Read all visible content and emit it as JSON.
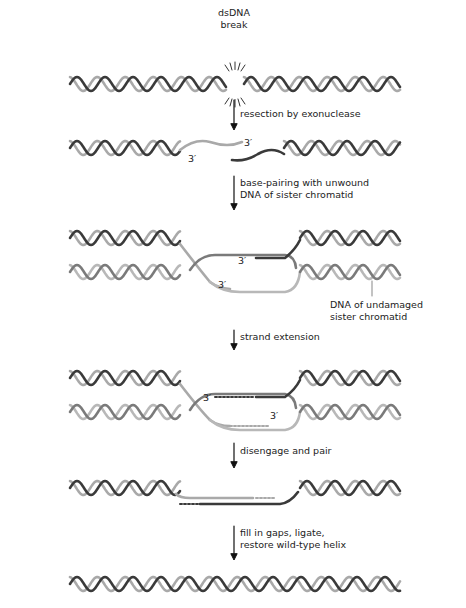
{
  "diagram": {
    "colors": {
      "dark_strand": "#3a3a3a",
      "light_strand": "#a9a9a9",
      "sister_dark": "#7a7a7a",
      "sister_light": "#b8b8b8",
      "text": "#222222"
    },
    "break_label": [
      "dsDNA",
      "break"
    ],
    "steps": [
      {
        "label_lines": [
          "resection by exonuclease"
        ]
      },
      {
        "label_lines": [
          "base-pairing with unwound",
          "DNA of sister chromatid"
        ]
      },
      {
        "label_lines": [
          "strand extension"
        ]
      },
      {
        "label_lines": [
          "disengage and pair"
        ]
      },
      {
        "label_lines": [
          "fill in gaps, ligate,",
          "restore wild-type helix"
        ]
      }
    ],
    "end_labels": {
      "row2_upper": "3′",
      "row2_lower": "3′",
      "row3_upper": "3′",
      "row3_lower": "3′",
      "row4_upper": "3′",
      "row4_lower": "3′"
    },
    "callout": [
      "DNA of undamaged",
      "sister chromatid"
    ]
  }
}
